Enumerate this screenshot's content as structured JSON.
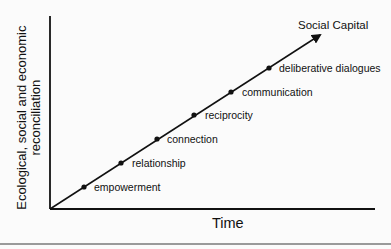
{
  "diagram": {
    "title": "Social Capital",
    "x_axis_label": "Time",
    "y_axis_label_line1": "Ecological, social and economic",
    "y_axis_label_line2": "reconciliation",
    "stages": [
      {
        "label": "empowerment"
      },
      {
        "label": "relationship"
      },
      {
        "label": "connection"
      },
      {
        "label": "reciprocity"
      },
      {
        "label": "communication"
      },
      {
        "label": "deliberative dialogues"
      }
    ]
  },
  "colors": {
    "line": "#111111",
    "background": "#fbfbfb",
    "rule": "#9a9a9a"
  }
}
